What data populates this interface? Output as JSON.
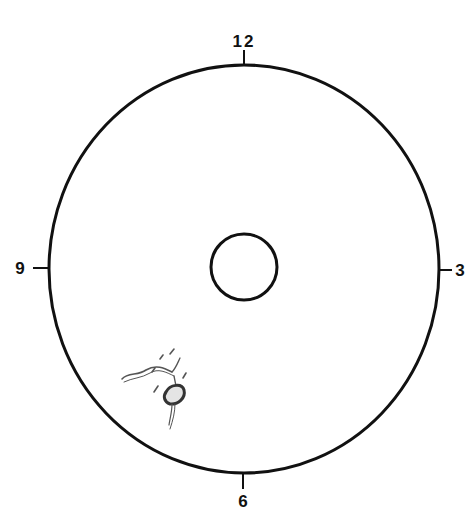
{
  "diagram": {
    "type": "clock-face fundus chart",
    "clock_labels": {
      "top": "12",
      "right": "3",
      "bottom": "6",
      "left": "9"
    },
    "outer_circle": {
      "cx": 244,
      "cy": 269,
      "rx": 195,
      "ry": 204
    },
    "inner_circle": {
      "cx": 244,
      "cy": 267,
      "r": 33
    },
    "lesion": {
      "position": "lower-left quadrant, approx 7-8 o'clock",
      "description": "sketched vessel with dark oval lesion"
    },
    "colors": {
      "line": "#111111",
      "sketch": "#555555",
      "background": "#ffffff"
    }
  }
}
